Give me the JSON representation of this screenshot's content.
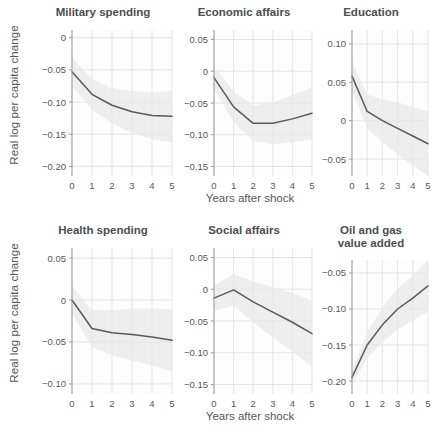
{
  "figure": {
    "width": 434,
    "height": 436,
    "background": "#ffffff",
    "line_color": "#595959",
    "band_color": "#e8e8e8",
    "grid_color": "#e2e2e2",
    "text_color": "#55585a",
    "title_color": "#4b4e50"
  },
  "axis": {
    "y_title": "Real log per capita change",
    "x_title": "Years after shock",
    "x_ticks": [
      "0",
      "1",
      "2",
      "3",
      "4",
      "5"
    ]
  },
  "chart_data": [
    {
      "type": "line",
      "title": "Military spending",
      "xlabel": "Years after shock",
      "ylabel": "Real log per capita change",
      "x": [
        0,
        1,
        2,
        3,
        4,
        5
      ],
      "values": [
        -0.053,
        -0.088,
        -0.105,
        -0.115,
        -0.121,
        -0.122
      ],
      "band_lower": [
        -0.075,
        -0.112,
        -0.133,
        -0.148,
        -0.158,
        -0.163
      ],
      "band_upper": [
        -0.031,
        -0.064,
        -0.078,
        -0.083,
        -0.085,
        -0.083
      ],
      "ylim": [
        -0.215,
        0.012
      ],
      "y_ticks": [
        0,
        -0.05,
        -0.1,
        -0.15,
        -0.2
      ],
      "y_tick_labels": [
        "0",
        "−0.05",
        "−0.10",
        "−0.15",
        "−0.20"
      ],
      "xlim": [
        0,
        5
      ],
      "grid": true,
      "legend": "none"
    },
    {
      "type": "line",
      "title": "Economic affairs",
      "xlabel": "Years after shock",
      "ylabel": "Real log per capita change",
      "x": [
        0,
        1,
        2,
        3,
        4,
        5
      ],
      "values": [
        -0.01,
        -0.056,
        -0.082,
        -0.082,
        -0.075,
        -0.066
      ],
      "band_lower": [
        -0.028,
        -0.08,
        -0.11,
        -0.115,
        -0.112,
        -0.107
      ],
      "band_upper": [
        0.008,
        -0.032,
        -0.054,
        -0.049,
        -0.038,
        -0.025
      ],
      "ylim": [
        -0.165,
        0.065
      ],
      "y_ticks": [
        0.05,
        0,
        -0.05,
        -0.1,
        -0.15
      ],
      "y_tick_labels": [
        "0.05",
        "0",
        "−0.05",
        "−0.10",
        "−0.15"
      ],
      "xlim": [
        0,
        5
      ],
      "grid": true,
      "legend": "none"
    },
    {
      "type": "line",
      "title": "Education",
      "xlabel": "Years after shock",
      "ylabel": "Real log per capita change",
      "x": [
        0,
        1,
        2,
        3,
        4,
        5
      ],
      "values": [
        0.058,
        0.012,
        0.0,
        -0.01,
        -0.02,
        -0.03
      ],
      "band_lower": [
        0.04,
        -0.01,
        -0.028,
        -0.044,
        -0.058,
        -0.072
      ],
      "band_upper": [
        0.076,
        0.034,
        0.028,
        0.024,
        0.018,
        0.012
      ],
      "ylim": [
        -0.072,
        0.118
      ],
      "y_ticks": [
        0.1,
        0.05,
        0,
        -0.05
      ],
      "y_tick_labels": [
        "0.10",
        "0.05",
        "0",
        "−0.05"
      ],
      "xlim": [
        0,
        5
      ],
      "grid": true,
      "legend": "none"
    },
    {
      "type": "line",
      "title": "Health spending",
      "xlabel": "Years after shock",
      "ylabel": "Real log per capita change",
      "x": [
        0,
        1,
        2,
        3,
        4,
        5
      ],
      "values": [
        0.0,
        -0.034,
        -0.039,
        -0.041,
        -0.044,
        -0.048
      ],
      "band_lower": [
        -0.016,
        -0.056,
        -0.066,
        -0.072,
        -0.078,
        -0.085
      ],
      "band_upper": [
        0.016,
        -0.012,
        -0.012,
        -0.01,
        -0.01,
        -0.011
      ],
      "ylim": [
        -0.112,
        0.062
      ],
      "y_ticks": [
        0.05,
        0,
        -0.05,
        -0.1
      ],
      "y_tick_labels": [
        "0.05",
        "0",
        "−0.05",
        "−0.10"
      ],
      "xlim": [
        0,
        5
      ],
      "grid": true,
      "legend": "none"
    },
    {
      "type": "line",
      "title": "Social affairs",
      "xlabel": "Years after shock",
      "ylabel": "Real log per capita change",
      "x": [
        0,
        1,
        2,
        3,
        4,
        5
      ],
      "values": [
        -0.014,
        -0.001,
        -0.02,
        -0.036,
        -0.052,
        -0.07
      ],
      "band_lower": [
        -0.034,
        -0.026,
        -0.052,
        -0.076,
        -0.098,
        -0.122
      ],
      "band_upper": [
        0.006,
        0.024,
        0.012,
        0.004,
        -0.006,
        -0.018
      ],
      "ylim": [
        -0.165,
        0.065
      ],
      "y_ticks": [
        0.05,
        0,
        -0.05,
        -0.1,
        -0.15
      ],
      "y_tick_labels": [
        "0.05",
        "0",
        "−0.05",
        "−0.10",
        "−0.15"
      ],
      "xlim": [
        0,
        5
      ],
      "grid": true,
      "legend": "none"
    },
    {
      "type": "line",
      "title": "Oil and gas\nvalue added",
      "xlabel": "Years after shock",
      "ylabel": "Real log per capita change",
      "x": [
        0,
        1,
        2,
        3,
        4,
        5
      ],
      "values": [
        -0.195,
        -0.15,
        -0.122,
        -0.1,
        -0.085,
        -0.068
      ],
      "band_lower": [
        -0.205,
        -0.168,
        -0.146,
        -0.128,
        -0.116,
        -0.104
      ],
      "band_upper": [
        -0.185,
        -0.132,
        -0.098,
        -0.072,
        -0.054,
        -0.032
      ],
      "ylim": [
        -0.218,
        -0.032
      ],
      "y_ticks": [
        -0.05,
        -0.1,
        -0.15,
        -0.2
      ],
      "y_tick_labels": [
        "−0.05",
        "−0.10",
        "−0.15",
        "−0.20"
      ],
      "xlim": [
        0,
        5
      ],
      "grid": true,
      "legend": "none"
    }
  ]
}
